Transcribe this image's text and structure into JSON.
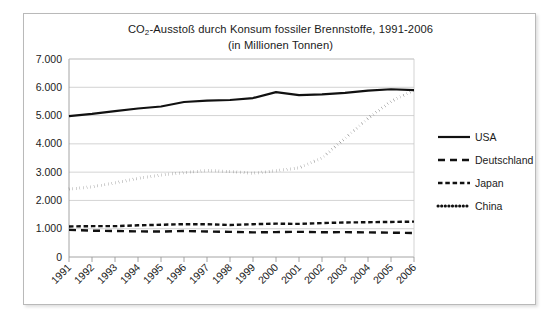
{
  "chart_data": {
    "type": "line",
    "title": "CO2-Ausstoß durch Konsum fossiler Brennstoffe, 1991-2006",
    "title_prefix": "CO",
    "title_sub": "2",
    "title_suffix": "-Ausstoß durch Konsum fossiler Brennstoffe, 1991-2006",
    "subtitle": "(in Millionen Tonnen)",
    "xlabel": "",
    "ylabel": "",
    "ylim": [
      0,
      7000
    ],
    "ytick_labels": [
      "7.000",
      "6.000",
      "5.000",
      "4.000",
      "3.000",
      "2.000",
      "1.000",
      "0"
    ],
    "ytick_values": [
      7000,
      6000,
      5000,
      4000,
      3000,
      2000,
      1000,
      0
    ],
    "grid": true,
    "legend_position": "right",
    "categories": [
      "1991",
      "1992",
      "1993",
      "1994",
      "1995",
      "1996",
      "1997",
      "1998",
      "1999",
      "2000",
      "2001",
      "2002",
      "2003",
      "2004",
      "2005",
      "2006"
    ],
    "series": [
      {
        "name": "USA",
        "style": "solid",
        "color": "#111111",
        "values": [
          4980,
          5060,
          5160,
          5250,
          5320,
          5480,
          5530,
          5550,
          5620,
          5830,
          5720,
          5750,
          5800,
          5880,
          5930,
          5900
        ]
      },
      {
        "name": "Deutschland",
        "style": "long-dash",
        "color": "#111111",
        "values": [
          960,
          930,
          920,
          905,
          900,
          920,
          900,
          890,
          870,
          880,
          890,
          875,
          880,
          870,
          860,
          850
        ]
      },
      {
        "name": "Japan",
        "style": "short-dash",
        "color": "#111111",
        "values": [
          1080,
          1090,
          1090,
          1120,
          1140,
          1160,
          1160,
          1130,
          1160,
          1180,
          1170,
          1200,
          1220,
          1230,
          1240,
          1250
        ]
      },
      {
        "name": "China",
        "style": "dotted",
        "color": "#111111",
        "values": [
          2400,
          2480,
          2620,
          2780,
          2900,
          2980,
          3060,
          3020,
          2960,
          3050,
          3150,
          3500,
          4200,
          4900,
          5500,
          5900
        ]
      }
    ]
  },
  "legend": {
    "items": [
      {
        "label": "USA",
        "style": "solid"
      },
      {
        "label": "Deutschland",
        "style": "long-dash"
      },
      {
        "label": "Japan",
        "style": "short-dash"
      },
      {
        "label": "China",
        "style": "dotted"
      }
    ]
  }
}
